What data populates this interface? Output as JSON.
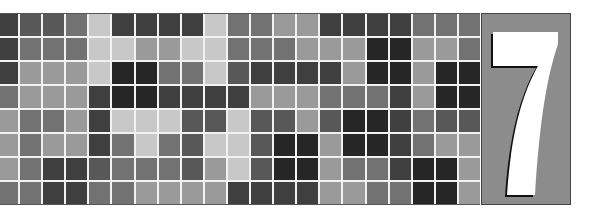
{
  "banner": {
    "chapter_number": "7",
    "panel_color": "#8c8c8c",
    "numeral_color": "#ffffff",
    "numeral_shadow_color": "#111111"
  },
  "mosaic": {
    "rows": 8,
    "cols": 21,
    "palette": {
      "vd": "#262626",
      "d": "#3f3f3f",
      "md": "#585858",
      "m": "#727272",
      "ml": "#9a9a9a",
      "l": "#c8c8c8"
    },
    "cells": [
      [
        "d",
        "md",
        "md",
        "m",
        "l",
        "d",
        "d",
        "d",
        "d",
        "l",
        "m",
        "m",
        "ml",
        "ml",
        "d",
        "d",
        "d",
        "d",
        "m",
        "m",
        "m"
      ],
      [
        "d",
        "m",
        "m",
        "m",
        "l",
        "l",
        "ml",
        "ml",
        "l",
        "l",
        "m",
        "m",
        "m",
        "ml",
        "ml",
        "ml",
        "vd",
        "vd",
        "ml",
        "ml",
        "m"
      ],
      [
        "d",
        "ml",
        "ml",
        "ml",
        "l",
        "vd",
        "vd",
        "m",
        "m",
        "l",
        "md",
        "d",
        "d",
        "d",
        "d",
        "ml",
        "vd",
        "vd",
        "ml",
        "vd",
        "vd"
      ],
      [
        "m",
        "ml",
        "ml",
        "ml",
        "d",
        "vd",
        "vd",
        "d",
        "d",
        "d",
        "d",
        "ml",
        "ml",
        "ml",
        "m",
        "m",
        "m",
        "d",
        "ml",
        "vd",
        "vd"
      ],
      [
        "ml",
        "m",
        "m",
        "ml",
        "d",
        "l",
        "l",
        "l",
        "md",
        "md",
        "l",
        "md",
        "md",
        "ml",
        "md",
        "vd",
        "vd",
        "d",
        "m",
        "md",
        "md"
      ],
      [
        "ml",
        "m",
        "ml",
        "ml",
        "d",
        "m",
        "l",
        "m",
        "md",
        "l",
        "l",
        "md",
        "vd",
        "vd",
        "ml",
        "vd",
        "vd",
        "d",
        "m",
        "ml",
        "ml"
      ],
      [
        "ml",
        "m",
        "d",
        "d",
        "md",
        "m",
        "m",
        "m",
        "md",
        "ml",
        "l",
        "md",
        "vd",
        "vd",
        "ml",
        "m",
        "m",
        "d",
        "vd",
        "vd",
        "ml"
      ],
      [
        "m",
        "m",
        "d",
        "d",
        "m",
        "m",
        "ml",
        "ml",
        "ml",
        "ml",
        "d",
        "d",
        "d",
        "d",
        "ml",
        "ml",
        "m",
        "m",
        "vd",
        "vd",
        "ml"
      ]
    ]
  }
}
